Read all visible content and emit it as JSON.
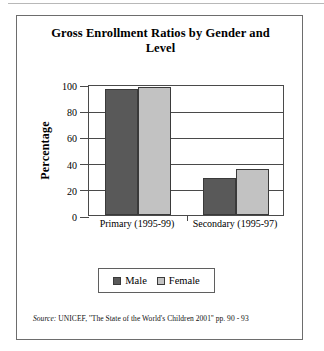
{
  "figure": {
    "title": "Gross Enrollment Ratios by Gender and Level",
    "source_label": "Source:",
    "source_text": "UNICEF, ''The State of the World's Children 2001'' pp. 90 - 93"
  },
  "legend": {
    "entries": [
      {
        "label": "Male",
        "color": "#595959",
        "swatch_icon": "legend-swatch-dark"
      },
      {
        "label": "Female",
        "color": "#c2c2c2",
        "swatch_icon": "legend-swatch-light"
      }
    ]
  },
  "axes": {
    "y_title": "Percentage",
    "y_ticks": [
      "0",
      "20",
      "40",
      "60",
      "80",
      "100"
    ],
    "x_categories": [
      "Primary (1995-99)",
      "Secondary (1995-97)"
    ]
  },
  "chart_data": {
    "type": "bar",
    "title": "Gross Enrollment Ratios by Gender and Level",
    "xlabel": "",
    "ylabel": "Percentage",
    "ylim": [
      0,
      100
    ],
    "ytick_interval": 20,
    "grid": true,
    "grid_axis": "y",
    "legend_position": "bottom",
    "categories": [
      "Primary (1995-99)",
      "Secondary (1995-97)"
    ],
    "series": [
      {
        "name": "Male",
        "color": "#595959",
        "values": [
          96,
          28
        ]
      },
      {
        "name": "Female",
        "color": "#c2c2c2",
        "values": [
          98,
          35
        ]
      }
    ],
    "annotations": [
      "Source: UNICEF, ''The State of the World's Children 2001'' pp. 90 - 93"
    ]
  }
}
